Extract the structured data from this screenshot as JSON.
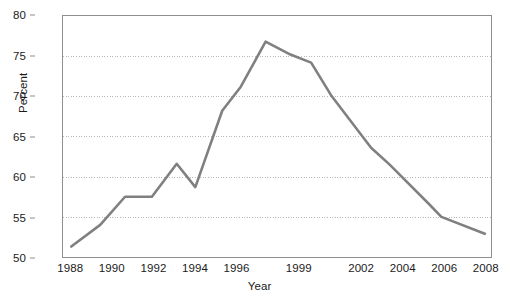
{
  "chart_data": {
    "type": "line",
    "title": "",
    "xlabel": "Year",
    "ylabel": "Percent",
    "xlim": [
      1987.6,
      2008.3
    ],
    "ylim": [
      50,
      80
    ],
    "yticks": [
      50,
      55,
      60,
      65,
      70,
      75,
      80
    ],
    "xticks": [
      1988,
      1990,
      1992,
      1994,
      1996,
      1999,
      2002,
      2004,
      2006,
      2008
    ],
    "xtick_labels": [
      "1988",
      "1990",
      "1992",
      "1994",
      "1996",
      "1999",
      "2002",
      "2004",
      "2006",
      "2008"
    ],
    "ytick_labels": [
      "50",
      "55",
      "60",
      "65",
      "70",
      "75",
      "80"
    ],
    "grid": "horizontal-dotted",
    "legend": "none",
    "line_color": "#808080",
    "line_width": 2.6,
    "axis_color": "#8e8e8e",
    "grid_color": "#b9b9b9",
    "text_color": "#1b1b1b",
    "background": "#ffffff",
    "series": [
      {
        "name": "Percent",
        "x": [
          1988.0,
          1989.4,
          1990.6,
          1991.9,
          1993.1,
          1994.0,
          1995.3,
          1996.2,
          1997.4,
          1998.6,
          1999.6,
          2000.6,
          2002.5,
          2003.4,
          2005.3,
          2005.9,
          2008.0
        ],
        "y": [
          51.3,
          54.0,
          57.5,
          57.5,
          61.6,
          58.7,
          68.2,
          71.2,
          76.8,
          75.2,
          74.2,
          70.0,
          63.6,
          61.5,
          56.6,
          55.0,
          52.9
        ]
      }
    ]
  }
}
